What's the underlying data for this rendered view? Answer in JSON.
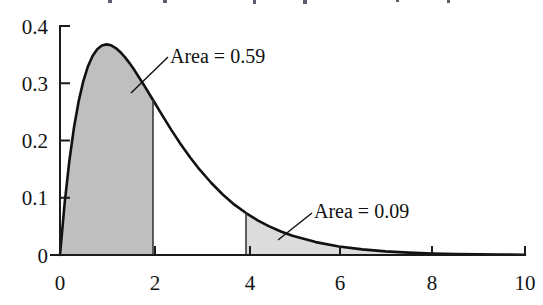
{
  "figure": {
    "background_color": "#ffffff",
    "curve_color": "#111111"
  },
  "chart_data": {
    "type": "area",
    "title": "",
    "subtitle": "",
    "xlabel": "",
    "ylabel": "",
    "xlim": [
      0,
      10
    ],
    "ylim": [
      0,
      0.4
    ],
    "grid": false,
    "legend": "none",
    "distribution": {
      "name": "gamma-density",
      "shape": 2,
      "scale": 1,
      "peak_x": 1,
      "peak_y": 0.368
    },
    "x_ticks": [
      0,
      2,
      4,
      6,
      8,
      10
    ],
    "x_tick_labels": [
      "0",
      "2",
      "4",
      "6",
      "8",
      "10"
    ],
    "y_ticks": [
      0,
      0.1,
      0.2,
      0.3,
      0.4
    ],
    "y_tick_labels": [
      "0",
      "0.1",
      "0.2",
      "0.3",
      "0.4"
    ],
    "series": [
      {
        "name": "density",
        "x": [
          0,
          0.1,
          0.2,
          0.3,
          0.4,
          0.5,
          0.6,
          0.7,
          0.8,
          0.9,
          1,
          1.1,
          1.2,
          1.3,
          1.4,
          1.5,
          1.6,
          1.8,
          2,
          2.2,
          2.4,
          2.6,
          2.8,
          3,
          3.25,
          3.5,
          3.75,
          4,
          4.25,
          4.5,
          4.75,
          5,
          5.5,
          6,
          6.5,
          7,
          7.5,
          8,
          8.5,
          9,
          9.5,
          10
        ],
        "y": [
          0,
          0.0905,
          0.1637,
          0.2222,
          0.2681,
          0.3033,
          0.3293,
          0.3476,
          0.3595,
          0.3659,
          0.3679,
          0.3662,
          0.3614,
          0.3543,
          0.3452,
          0.3347,
          0.323,
          0.2975,
          0.2707,
          0.2438,
          0.2177,
          0.1931,
          0.1703,
          0.1494,
          0.1262,
          0.1057,
          0.0879,
          0.0733,
          0.0605,
          0.05,
          0.0411,
          0.0337,
          0.0225,
          0.0149,
          0.0098,
          0.0064,
          0.0041,
          0.0027,
          0.0017,
          0.0011,
          0.0007,
          0.0005
        ]
      }
    ],
    "shaded_regions": [
      {
        "name": "lower-tail",
        "x_from": 0,
        "x_to": 2,
        "fill_color": "#bfbfbf",
        "area": 0.59,
        "label": "Area = 0.59"
      },
      {
        "name": "upper-tail",
        "x_from": 4,
        "x_to": 10,
        "fill_color": "#dcdcdc",
        "area": 0.09,
        "label": "Area = 0.09"
      }
    ],
    "annotations": [
      {
        "name": "area-left",
        "text": "Area = 0.59",
        "x": 3.45,
        "y": 0.345
      },
      {
        "name": "area-right",
        "text": "Area = 0.09",
        "x": 6.45,
        "y": 0.104
      }
    ]
  }
}
